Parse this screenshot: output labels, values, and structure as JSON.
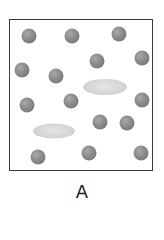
{
  "diagram": {
    "label": "A",
    "colors": {
      "border": "#3a3a3a",
      "sphere": "#8a8a8a",
      "ellipse": "#d4d4d4"
    },
    "spheres": [
      {
        "x": 29,
        "y": 36
      },
      {
        "x": 72,
        "y": 36
      },
      {
        "x": 119,
        "y": 34
      },
      {
        "x": 97,
        "y": 61
      },
      {
        "x": 142,
        "y": 58
      },
      {
        "x": 22,
        "y": 70
      },
      {
        "x": 56,
        "y": 76
      },
      {
        "x": 142,
        "y": 100
      },
      {
        "x": 71,
        "y": 101
      },
      {
        "x": 27,
        "y": 105
      },
      {
        "x": 100,
        "y": 122
      },
      {
        "x": 127,
        "y": 123
      },
      {
        "x": 38,
        "y": 157
      },
      {
        "x": 89,
        "y": 153
      },
      {
        "x": 141,
        "y": 153
      }
    ],
    "ellipses": [
      {
        "x": 105,
        "y": 87,
        "w": 44,
        "h": 16
      },
      {
        "x": 54,
        "y": 131,
        "w": 42,
        "h": 15
      }
    ]
  }
}
